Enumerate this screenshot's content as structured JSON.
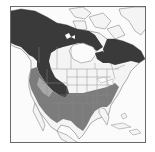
{
  "map": {
    "region": "North America",
    "type": "species range map",
    "legend": [],
    "colors": {
      "background": "#fbfbfb",
      "land": "#f4f4f4",
      "outline": "#8a8a8a",
      "range_dark": "#3a3a3a",
      "range_medium": "#7c7c7c",
      "range_light": "#a8a8a8",
      "frame": "#6a6a6a"
    },
    "zones": [
      {
        "name": "northern-range",
        "shade": "dark",
        "extent": "Alaska, western and central Canada, Quebec-Labrador, northern Rockies"
      },
      {
        "name": "southern-range",
        "shade": "medium",
        "extent": "Pacific Northwest, Great Basin, southern and eastern United States"
      }
    ]
  }
}
